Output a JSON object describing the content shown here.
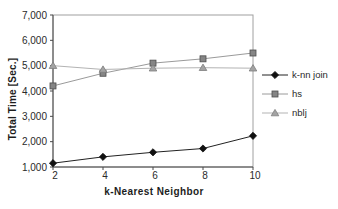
{
  "chart_data": {
    "type": "line",
    "title": "",
    "xlabel": "k-Nearest Neighbor",
    "ylabel": "Total Time [Sec.]",
    "x": [
      2,
      4,
      6,
      8,
      10
    ],
    "x_tick_labels": [
      "2",
      "4",
      "6",
      "8",
      "10"
    ],
    "y_ticks": [
      1000,
      2000,
      3000,
      4000,
      5000,
      6000,
      7000
    ],
    "y_tick_labels": [
      "1,000",
      "2,000",
      "3,000",
      "4,000",
      "5,000",
      "6,000",
      "7,000"
    ],
    "xlim": [
      2,
      10
    ],
    "ylim": [
      1000,
      7000
    ],
    "grid": false,
    "legend_position": "right-middle",
    "series": [
      {
        "name": "k-nn join",
        "values": [
          1150,
          1400,
          1580,
          1730,
          2230
        ],
        "marker": "diamond",
        "line_color": "#222222",
        "marker_fill": "#111111",
        "marker_edge": "#111111"
      },
      {
        "name": "hs",
        "values": [
          4200,
          4700,
          5100,
          5270,
          5500
        ],
        "marker": "square",
        "line_color": "#9a9a9a",
        "marker_fill": "#858585",
        "marker_edge": "#4d4d4d"
      },
      {
        "name": "nblj",
        "values": [
          5000,
          4850,
          4900,
          4920,
          4900
        ],
        "marker": "triangle",
        "line_color": "#b3b3b3",
        "marker_fill": "#a3a3a3",
        "marker_edge": "#7d7d7d"
      }
    ],
    "plot_border_color": "#a0a0a0",
    "axis_color": "#4a4a4a"
  }
}
